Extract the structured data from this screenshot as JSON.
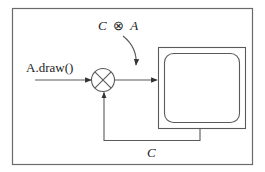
{
  "diagram": {
    "input_label": "A.draw()",
    "composite_label": {
      "left": "C",
      "operator": "⊗",
      "right": "A"
    },
    "feedback_label": "C",
    "operator_symbol": "circle-cross",
    "output_device": "monitor-screen",
    "colors": {
      "line": "#5a5a5a",
      "frame": "#6a6a6a",
      "text": "#222222",
      "background": "#ffffff"
    }
  }
}
